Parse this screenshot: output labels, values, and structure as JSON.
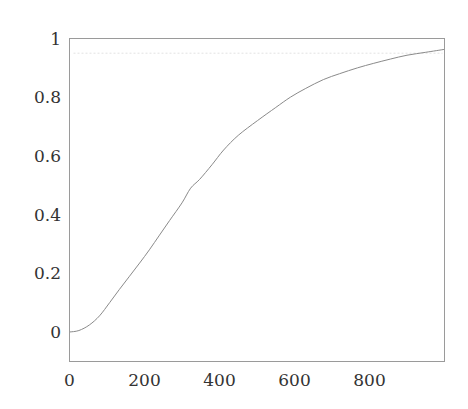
{
  "chart_data": {
    "type": "line",
    "title": "",
    "xlabel": "",
    "ylabel": "",
    "xlim": [
      0,
      1000
    ],
    "ylim": [
      -0.1,
      1.0
    ],
    "grid": false,
    "legend": null,
    "x_ticks": [
      0,
      200,
      400,
      600,
      800
    ],
    "x_tick_labels": [
      "0",
      "200",
      "400",
      "600",
      "800"
    ],
    "y_ticks": [
      0,
      0.2,
      0.4,
      0.6,
      0.8,
      1
    ],
    "y_tick_labels": [
      "0",
      "0.2",
      "0.4",
      "0.6",
      "0.8",
      "1"
    ],
    "series": [
      {
        "name": "curve",
        "color": "#8a8a8a",
        "x": [
          0,
          25,
          53,
          80,
          107,
          133,
          160,
          187,
          213,
          240,
          267,
          300,
          323,
          347,
          380,
          411,
          450,
          501,
          550,
          589,
          630,
          677,
          720,
          768,
          810,
          856,
          900,
          950,
          1000
        ],
        "y": [
          0,
          0.005,
          0.024,
          0.055,
          0.1,
          0.145,
          0.19,
          0.235,
          0.28,
          0.33,
          0.38,
          0.44,
          0.49,
          0.52,
          0.57,
          0.62,
          0.67,
          0.72,
          0.765,
          0.8,
          0.83,
          0.86,
          0.88,
          0.9,
          0.915,
          0.93,
          0.943,
          0.953,
          0.963
        ]
      }
    ],
    "annotations": [
      {
        "type": "hline",
        "y": 0.95,
        "style": "dotted",
        "color": "#e2e2e2"
      }
    ]
  }
}
